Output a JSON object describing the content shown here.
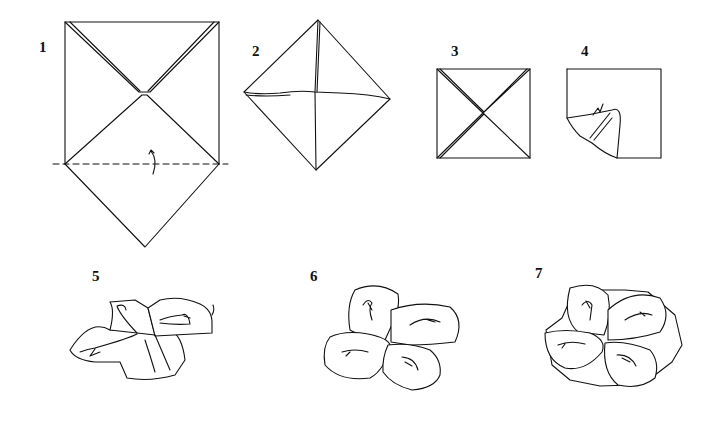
{
  "diagram": {
    "type": "origami instructions",
    "steps": [
      {
        "number": "1",
        "description": "Square with corners folded to center; dashed valley fold line with fold arrow"
      },
      {
        "number": "2",
        "description": "Diamond with four corners folded to center"
      },
      {
        "number": "3",
        "description": "Square with folded corners meeting at center"
      },
      {
        "number": "4",
        "description": "Square with one corner being curled/rolled outward"
      },
      {
        "number": "5",
        "description": "Four petals, one rolled, arrow indicating rotation"
      },
      {
        "number": "6",
        "description": "Four rolled petals forming flower"
      },
      {
        "number": "7",
        "description": "Completed flower with rolled petals and ruffled edges"
      }
    ],
    "colors": {
      "background": "#ffffff",
      "line": "#111111"
    }
  }
}
